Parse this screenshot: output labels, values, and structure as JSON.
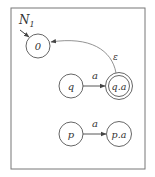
{
  "diagram": {
    "title": "N",
    "title_subscript": "1",
    "nodes": [
      {
        "id": "0",
        "label": "0",
        "cx": 38,
        "cy": 46,
        "accepting": false,
        "start": true
      },
      {
        "id": "q",
        "label": "q",
        "cx": 71,
        "cy": 86,
        "accepting": false,
        "start": false
      },
      {
        "id": "qa",
        "label": "q.a",
        "cx": 119,
        "cy": 86,
        "accepting": true,
        "start": false
      },
      {
        "id": "p",
        "label": "p",
        "cx": 71,
        "cy": 134,
        "accepting": false,
        "start": false
      },
      {
        "id": "pa",
        "label": "p.a",
        "cx": 119,
        "cy": 134,
        "accepting": false,
        "start": false
      }
    ],
    "edges": [
      {
        "from": "q",
        "to": "qa",
        "label": "a"
      },
      {
        "from": "p",
        "to": "pa",
        "label": "a"
      },
      {
        "from": "qa",
        "to": "0",
        "label": "ε"
      }
    ],
    "colors": {
      "stroke": "#555555",
      "text": "#333333",
      "frame": "#777777"
    }
  }
}
